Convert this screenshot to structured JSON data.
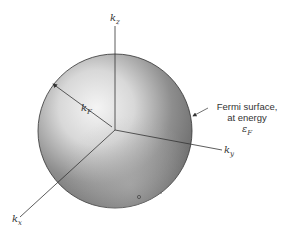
{
  "diagram": {
    "axes": {
      "kz": {
        "base": "k",
        "sub": "z"
      },
      "ky": {
        "base": "k",
        "sub": "y"
      },
      "kx": {
        "base": "k",
        "sub": "x"
      }
    },
    "radius_label": {
      "base": "k",
      "sub": "F"
    },
    "surface_annotation": {
      "line1": "Fermi surface,",
      "line2": "at energy",
      "line3_symbol": "ε",
      "line3_sub": "F"
    },
    "colors": {
      "sphere_light": "#f2f2f2",
      "sphere_dark": "#6e6e6e",
      "line": "#333333"
    }
  }
}
